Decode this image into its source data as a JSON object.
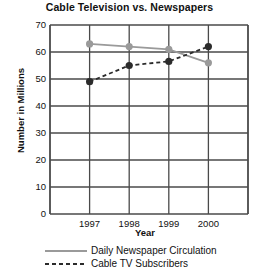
{
  "chart_data": {
    "type": "line",
    "title": "Cable Television vs. Newspapers",
    "xlabel": "Year",
    "ylabel": "Number in Millions",
    "categories": [
      "1997",
      "1998",
      "1999",
      "2000"
    ],
    "ylim": [
      0,
      70
    ],
    "yticks": [
      "0",
      "10",
      "20",
      "30",
      "40",
      "50",
      "60",
      "70"
    ],
    "grid": true,
    "legend_position": "bottom",
    "series": [
      {
        "name": "Daily Newspaper Circulation",
        "values": [
          63,
          62,
          61,
          56
        ],
        "color": "#9a9a9a",
        "style": "solid",
        "marker": "circle"
      },
      {
        "name": "Cable TV Subscribers",
        "values": [
          49,
          55,
          56.5,
          62
        ],
        "color": "#2b2b2b",
        "style": "dashed",
        "marker": "circle"
      }
    ]
  },
  "legend": {
    "items": [
      {
        "label": "Daily Newspaper Circulation"
      },
      {
        "label": "Cable TV Subscribers"
      }
    ]
  },
  "colors": {
    "axis": "#3d3d3d",
    "grid": "#4a4a4a",
    "background": "#ffffff",
    "newspaper": "#9a9a9a",
    "cable": "#2b2b2b"
  }
}
